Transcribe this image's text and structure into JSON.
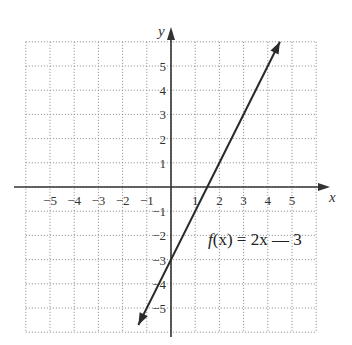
{
  "chart_data": {
    "type": "line",
    "title": "",
    "xlabel": "x",
    "ylabel": "y",
    "xlim": [
      -6,
      6
    ],
    "ylim": [
      -6,
      6
    ],
    "grid": true,
    "grid_style": "dotted",
    "x_ticks": [
      -5,
      -4,
      -3,
      -2,
      -1,
      1,
      2,
      3,
      4,
      5
    ],
    "y_ticks": [
      5,
      4,
      3,
      2,
      1,
      -1,
      -2,
      -3,
      -4,
      -5
    ],
    "x_tick_labels": [
      "−5",
      "−4",
      "−3",
      "−2",
      "−1",
      "1",
      "2",
      "3",
      "4",
      "5"
    ],
    "y_tick_labels": [
      "5",
      "4",
      "3",
      "2",
      "1",
      "−1",
      "−2",
      "−3",
      "−4",
      "−5"
    ],
    "series": [
      {
        "name": "f(x) = 2x — 3",
        "equation": "f(x) = 2x - 3",
        "slope": 2,
        "intercept": -3,
        "x": [
          -1.4,
          0,
          1.5,
          3,
          4.5
        ],
        "y": [
          -5.8,
          -3,
          0,
          3,
          6
        ],
        "arrows": "both"
      }
    ],
    "annotations": [
      {
        "text": "f(x) = 2x — 3",
        "x": 3.5,
        "y": -2.1
      }
    ],
    "colors": {
      "line": "#2a2a2a",
      "axis": "#333333",
      "grid": "#9a9a9a"
    }
  },
  "labels": {
    "x_axis": "x",
    "y_axis": "y",
    "equation_f": "f",
    "equation_rest": "(x) = 2x — 3"
  }
}
